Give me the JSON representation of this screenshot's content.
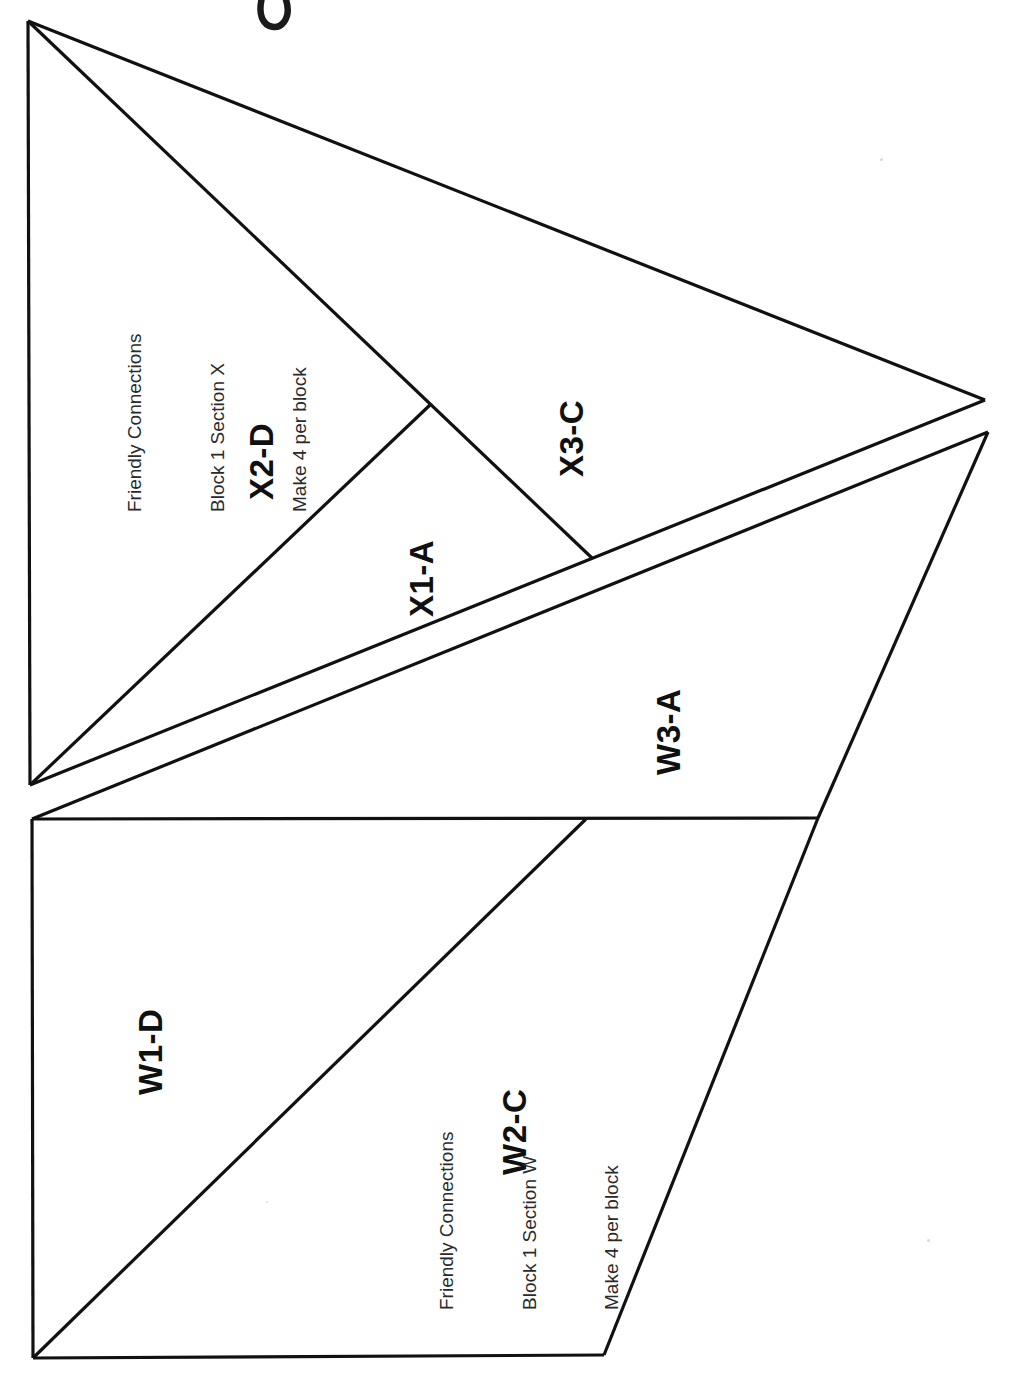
{
  "document": {
    "kind": "paper-piecing-pattern-sheet",
    "orientation": "rotated-90",
    "background_color": "#ffffff",
    "line_color": "#111111"
  },
  "sections": [
    {
      "id": "section-x",
      "info": {
        "line1": "Friendly Connections",
        "line2": "Block 1 Section X",
        "line3": "Make 4 per block"
      },
      "pieces": [
        {
          "id": "x2d",
          "label": "X2-D"
        },
        {
          "id": "x1a",
          "label": "X1-A"
        },
        {
          "id": "x3c",
          "label": "X3-C"
        }
      ]
    },
    {
      "id": "section-w",
      "info": {
        "line1": "Friendly Connections",
        "line2": "Block 1 Section W",
        "line3": "Make 4 per block"
      },
      "pieces": [
        {
          "id": "w3a",
          "label": "W3-A"
        },
        {
          "id": "w1d",
          "label": "W1-D"
        },
        {
          "id": "w2c",
          "label": "W2-C"
        }
      ]
    }
  ],
  "marks": {
    "handwritten_scribble": "partial ink mark at top edge"
  }
}
